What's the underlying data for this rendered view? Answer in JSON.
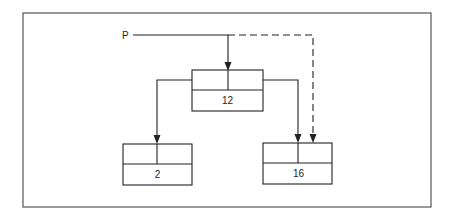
{
  "diagram": {
    "type": "binary-search-tree-pointer-illustration",
    "pointer": {
      "label": "P"
    },
    "nodes": [
      {
        "id": "root",
        "value": "12"
      },
      {
        "id": "left",
        "value": "2"
      },
      {
        "id": "right",
        "value": "16"
      }
    ],
    "edges": [
      {
        "from": "P",
        "to": "root",
        "style": "solid"
      },
      {
        "from": "P",
        "to": "right",
        "style": "dashed"
      },
      {
        "from": "root",
        "to": "left",
        "style": "solid"
      },
      {
        "from": "root",
        "to": "right",
        "style": "solid"
      }
    ],
    "colors": {
      "stroke": "#222222",
      "frame": "#555555",
      "background": "#ffffff"
    }
  }
}
